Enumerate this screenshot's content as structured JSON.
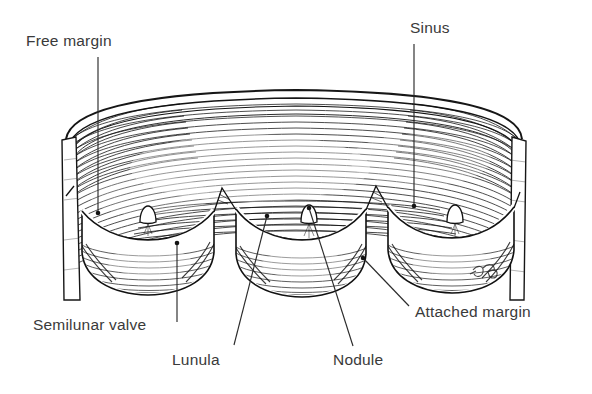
{
  "figure": {
    "title": "Semilunar valve",
    "width": 592,
    "height": 394,
    "background_color": "#ffffff",
    "ink_color": "#1a1a1a",
    "label_color": "#3a3a3a",
    "signature": "artist-monogram"
  },
  "labels": [
    {
      "id": "free-margin",
      "text": "Free margin",
      "text_x": 26,
      "text_y": 46,
      "anchor": "start",
      "leader": {
        "type": "line",
        "x1": 98,
        "y1": 57,
        "x2": 98,
        "y2": 213,
        "dot_at": "end",
        "dot_x": 98,
        "dot_y": 213
      }
    },
    {
      "id": "sinus",
      "text": "Sinus",
      "text_x": 410,
      "text_y": 33,
      "anchor": "start",
      "leader": {
        "type": "line",
        "x1": 414,
        "y1": 44,
        "x2": 414,
        "y2": 206,
        "dot_at": "end",
        "dot_x": 414,
        "dot_y": 206
      }
    },
    {
      "id": "semilunar-valve",
      "text": "Semilunar valve",
      "text_x": 33,
      "text_y": 330,
      "anchor": "start",
      "leader": {
        "type": "line",
        "x1": 177,
        "y1": 243,
        "x2": 177,
        "y2": 322,
        "dot_at": "start",
        "dot_x": 177,
        "dot_y": 243
      }
    },
    {
      "id": "lunula",
      "text": "Lunula",
      "text_x": 172,
      "text_y": 365,
      "anchor": "start",
      "leader": {
        "type": "line",
        "x1": 267,
        "y1": 216,
        "x2": 234,
        "y2": 345,
        "dot_at": "start",
        "dot_x": 267,
        "dot_y": 216
      }
    },
    {
      "id": "nodule",
      "text": "Nodule",
      "text_x": 333,
      "text_y": 365,
      "anchor": "start",
      "leader": {
        "type": "line",
        "x1": 309,
        "y1": 208,
        "x2": 353,
        "y2": 346,
        "dot_at": "start",
        "dot_x": 309,
        "dot_y": 208
      }
    },
    {
      "id": "attached-margin",
      "text": "Attached margin",
      "text_x": 415,
      "text_y": 317,
      "anchor": "start",
      "leader": {
        "type": "line",
        "x1": 363,
        "y1": 258,
        "x2": 409,
        "y2": 306,
        "dot_at": "start",
        "dot_x": 363,
        "dot_y": 258
      }
    }
  ],
  "anatomy": {
    "vessel_wall": {
      "name": "great-vessel-wall",
      "left_edge_x": 62,
      "right_edge_x": 525,
      "top_y": 88,
      "bottom_y": 300
    },
    "cusps": [
      {
        "id": "cusp-left",
        "center_x": 145,
        "free_margin_y": 214,
        "bottom_y": 288
      },
      {
        "id": "cusp-middle",
        "center_x": 300,
        "free_margin_y": 212,
        "bottom_y": 292
      },
      {
        "id": "cusp-right",
        "center_x": 450,
        "free_margin_y": 210,
        "bottom_y": 286
      }
    ],
    "nodules": [
      {
        "id": "nodule-left",
        "x": 148,
        "y": 216
      },
      {
        "id": "nodule-mid",
        "x": 309,
        "y": 208
      },
      {
        "id": "nodule-right",
        "x": 455,
        "y": 208
      }
    ]
  }
}
